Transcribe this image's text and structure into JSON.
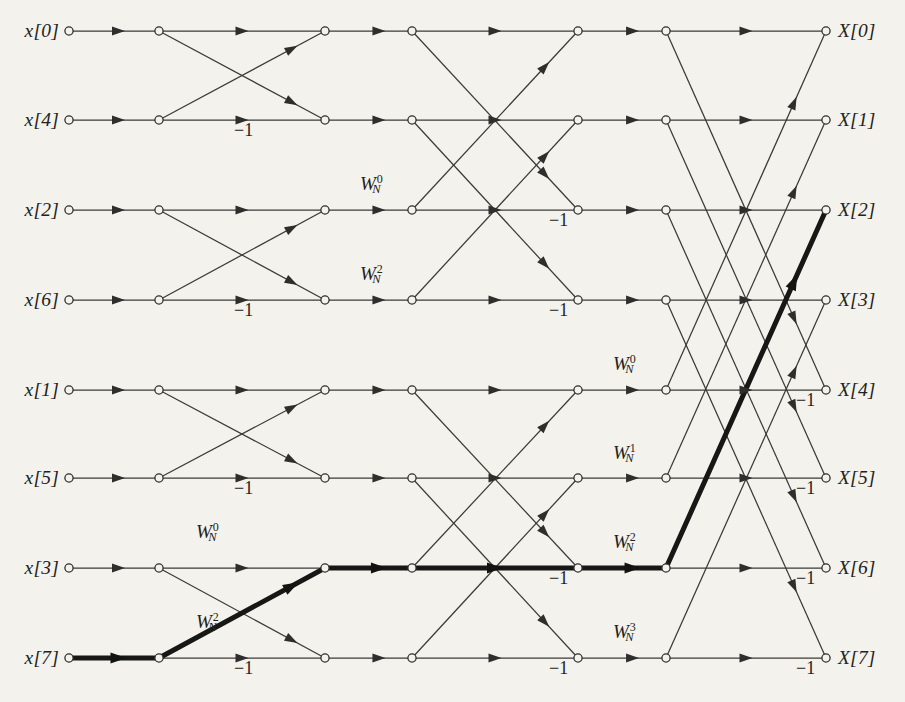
{
  "figure": {
    "type": "signal-flow-graph",
    "name": "8-point decimation-in-time FFT butterfly flow graph",
    "stages": 3,
    "points": 8,
    "background_color": "#f4f2ec",
    "line_color": "#3a3a38",
    "highlight_color": "#171715"
  },
  "geometry": {
    "columns": [
      69,
      159,
      325,
      412,
      578,
      666,
      826
    ],
    "rows": [
      31,
      120,
      210,
      300,
      390,
      478,
      568,
      658
    ]
  },
  "inputs": [
    {
      "label": "x[0]",
      "row": 0
    },
    {
      "label": "x[4]",
      "row": 1
    },
    {
      "label": "x[2]",
      "row": 2
    },
    {
      "label": "x[6]",
      "row": 3
    },
    {
      "label": "x[1]",
      "row": 4
    },
    {
      "label": "x[5]",
      "row": 5
    },
    {
      "label": "x[3]",
      "row": 6
    },
    {
      "label": "x[7]",
      "row": 7
    }
  ],
  "outputs": [
    {
      "label": "X[0]",
      "row": 0
    },
    {
      "label": "X[1]",
      "row": 1
    },
    {
      "label": "X[2]",
      "row": 2
    },
    {
      "label": "X[3]",
      "row": 3
    },
    {
      "label": "X[4]",
      "row": 4
    },
    {
      "label": "X[5]",
      "row": 5
    },
    {
      "label": "X[6]",
      "row": 6
    },
    {
      "label": "X[7]",
      "row": 7
    }
  ],
  "twiddle_labels": [
    {
      "text": "W",
      "sub": "N",
      "sup": "0",
      "x": 360,
      "y": 183,
      "stage": 2,
      "row": 2
    },
    {
      "text": "W",
      "sub": "N",
      "sup": "2",
      "x": 360,
      "y": 273,
      "stage": 2,
      "row": 3
    },
    {
      "text": "W",
      "sub": "N",
      "sup": "0",
      "x": 196,
      "y": 531,
      "stage": 2,
      "row": 6
    },
    {
      "text": "W",
      "sub": "N",
      "sup": "2",
      "x": 196,
      "y": 621,
      "stage": 2,
      "row": 7
    },
    {
      "text": "W",
      "sub": "N",
      "sup": "0",
      "x": 613,
      "y": 363,
      "stage": 3,
      "row": 4
    },
    {
      "text": "W",
      "sub": "N",
      "sup": "1",
      "x": 613,
      "y": 452,
      "stage": 3,
      "row": 5
    },
    {
      "text": "W",
      "sub": "N",
      "sup": "2",
      "x": 613,
      "y": 541,
      "stage": 3,
      "row": 6
    },
    {
      "text": "W",
      "sub": "N",
      "sup": "3",
      "x": 613,
      "y": 631,
      "stage": 3,
      "row": 7
    }
  ],
  "minus_one_labels": [
    {
      "text": "−1",
      "x": 234,
      "y": 130
    },
    {
      "text": "−1",
      "x": 234,
      "y": 310
    },
    {
      "text": "−1",
      "x": 234,
      "y": 488
    },
    {
      "text": "−1",
      "x": 234,
      "y": 668
    },
    {
      "text": "−1",
      "x": 549,
      "y": 220
    },
    {
      "text": "−1",
      "x": 549,
      "y": 310
    },
    {
      "text": "−1",
      "x": 549,
      "y": 578
    },
    {
      "text": "−1",
      "x": 549,
      "y": 668
    },
    {
      "text": "−1",
      "x": 796,
      "y": 400
    },
    {
      "text": "−1",
      "x": 796,
      "y": 488
    },
    {
      "text": "−1",
      "x": 796,
      "y": 578
    },
    {
      "text": "−1",
      "x": 796,
      "y": 668
    }
  ],
  "stage_structure": [
    {
      "stage": 1,
      "from_col": 1,
      "to_col": 2,
      "span": 1,
      "pairs": [
        [
          0,
          1
        ],
        [
          2,
          3
        ],
        [
          4,
          5
        ],
        [
          6,
          7
        ]
      ]
    },
    {
      "stage": 2,
      "from_col": 3,
      "to_col": 4,
      "span": 2,
      "pairs": [
        [
          0,
          2
        ],
        [
          1,
          3
        ],
        [
          4,
          6
        ],
        [
          5,
          7
        ]
      ]
    },
    {
      "stage": 3,
      "from_col": 5,
      "to_col": 6,
      "span": 4,
      "pairs": [
        [
          0,
          4
        ],
        [
          1,
          5
        ],
        [
          2,
          6
        ],
        [
          3,
          7
        ]
      ]
    }
  ],
  "highlight_path": {
    "description": "bold path from x[7] to X[2]",
    "segments": [
      {
        "from_col": 0,
        "from_row": 7,
        "to_col": 1,
        "to_row": 7
      },
      {
        "from_col": 1,
        "from_row": 7,
        "to_col": 2,
        "to_row": 6
      },
      {
        "from_col": 2,
        "from_row": 6,
        "to_col": 3,
        "to_row": 6
      },
      {
        "from_col": 3,
        "from_row": 6,
        "to_col": 4,
        "to_row": 6
      },
      {
        "from_col": 4,
        "from_row": 6,
        "to_col": 5,
        "to_row": 6
      },
      {
        "from_col": 5,
        "from_row": 6,
        "to_col": 6,
        "to_row": 2
      }
    ]
  }
}
